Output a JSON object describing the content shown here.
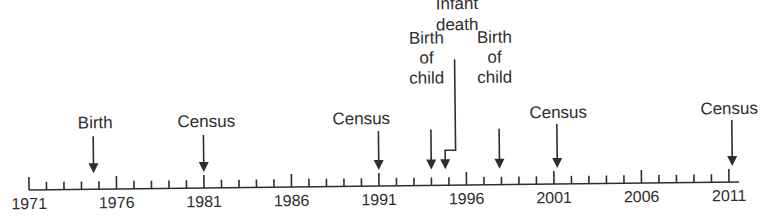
{
  "diagram": {
    "type": "timeline",
    "axis": {
      "start_year": 1971,
      "end_year": 2011,
      "minor_tick_step": 1,
      "major_tick_step": 5,
      "labeled_years": [
        "1971",
        "1976",
        "1981",
        "1986",
        "1991",
        "1996",
        "2001",
        "2006",
        "2011"
      ]
    },
    "events": [
      {
        "id": "birth",
        "lines": [
          "Birth"
        ],
        "year": 1974.7
      },
      {
        "id": "census-1981",
        "lines": [
          "Census"
        ],
        "year": 1981
      },
      {
        "id": "census-1991",
        "lines": [
          "Census"
        ],
        "year": 1991
      },
      {
        "id": "birth-of-child-1",
        "lines": [
          "Birth",
          "of",
          "child"
        ],
        "year": 1994
      },
      {
        "id": "infant-death",
        "lines": [
          "Infant",
          "death"
        ],
        "year": 1994.8
      },
      {
        "id": "birth-of-child-2",
        "lines": [
          "Birth",
          "of",
          "child"
        ],
        "year": 1997.9
      },
      {
        "id": "census-2001",
        "lines": [
          "Census"
        ],
        "year": 2001.2
      },
      {
        "id": "census-2011",
        "lines": [
          "Census"
        ],
        "year": 2011.2
      }
    ]
  },
  "colors": {
    "background": "#ffffff",
    "ink": "#2e2e2e"
  }
}
